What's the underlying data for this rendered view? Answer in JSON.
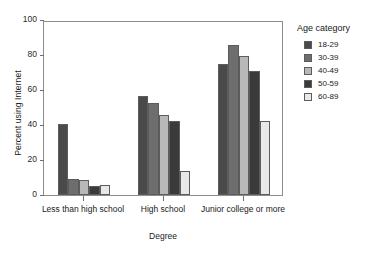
{
  "chart_data": {
    "type": "bar",
    "title": "",
    "xlabel": "Degree",
    "ylabel": "Percent using Internet",
    "categories": [
      "Less than high school",
      "High school",
      "Junior college or more"
    ],
    "series": [
      {
        "name": "18-29",
        "color": "#4a4a4a",
        "values": [
          40.7,
          56.3,
          74.8
        ]
      },
      {
        "name": "30-39",
        "color": "#6e6e6e",
        "values": [
          9.0,
          52.5,
          86.0
        ]
      },
      {
        "name": "40-49",
        "color": "#b8b8b8",
        "values": [
          8.8,
          45.8,
          79.5
        ]
      },
      {
        "name": "50-59",
        "color": "#3a3a3a",
        "values": [
          5.0,
          42.3,
          71.0
        ]
      },
      {
        "name": "60-89",
        "color": "#e8e8e8",
        "values": [
          6.0,
          13.5,
          42.5
        ]
      }
    ],
    "ylim": [
      0,
      100
    ],
    "yticks": [
      0,
      20,
      40,
      60,
      80,
      100
    ],
    "ytick_labels": [
      "0",
      "20",
      "40",
      "60",
      "80",
      "100"
    ],
    "grid": false,
    "legend_position": "right",
    "legend_title": "Age category"
  }
}
